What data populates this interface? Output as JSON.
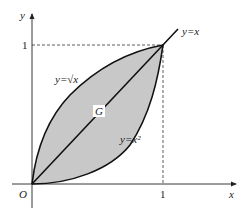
{
  "diagram": {
    "axes": {
      "x_label": "x",
      "y_label": "y",
      "origin_label": "O",
      "x_tick_label": "1",
      "y_tick_label": "1"
    },
    "curves": {
      "sqrt": {
        "label": "y=√x"
      },
      "line": {
        "label": "y=x"
      },
      "square": {
        "label": "y=x²"
      }
    },
    "region": {
      "label": "G",
      "fill": "#c8c8c8"
    },
    "colors": {
      "stroke": "#111111",
      "axis": "#222222",
      "dash": "#333333"
    }
  }
}
